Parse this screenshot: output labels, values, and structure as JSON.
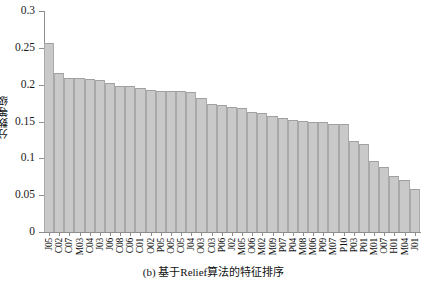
{
  "chart_data": {
    "type": "bar",
    "title": "",
    "caption": "(b) 基于Relief算法的特征排序",
    "xlabel": "",
    "ylabel": "分数等级",
    "ylim": [
      0,
      0.3
    ],
    "yticks": [
      0,
      0.05,
      0.1,
      0.15,
      0.2,
      0.25,
      0.3
    ],
    "ytick_labels": [
      "0",
      "0.05",
      "0.1",
      "0.15",
      "0.2",
      "0.25",
      "0.3"
    ],
    "grid": false,
    "legend": null,
    "bar_color": "#c9c9c9",
    "bar_edge_color": "#a9a9a9",
    "axis_color": "#8d8d8d",
    "categories": [
      "J05",
      "C02",
      "C07",
      "M03",
      "C04",
      "J03",
      "J06",
      "C08",
      "C06",
      "C01",
      "O02",
      "P05",
      "O05",
      "C05",
      "J04",
      "O03",
      "C03",
      "P06",
      "J02",
      "M05",
      "O06",
      "M02",
      "M09",
      "P07",
      "P04",
      "M08",
      "M06",
      "P09",
      "M07",
      "P10",
      "P03",
      "P01",
      "M01",
      "O07",
      "H01",
      "M04",
      "J01"
    ],
    "values": [
      0.257,
      0.216,
      0.209,
      0.209,
      0.208,
      0.207,
      0.202,
      0.198,
      0.198,
      0.195,
      0.193,
      0.192,
      0.192,
      0.191,
      0.19,
      0.182,
      0.174,
      0.172,
      0.17,
      0.168,
      0.163,
      0.161,
      0.158,
      0.155,
      0.152,
      0.151,
      0.15,
      0.149,
      0.147,
      0.146,
      0.124,
      0.12,
      0.096,
      0.088,
      0.076,
      0.071,
      0.058
    ]
  }
}
